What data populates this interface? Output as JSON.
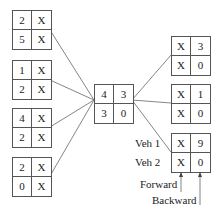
{
  "left_nodes": [
    {
      "id": "L1",
      "cells": [
        [
          "2",
          "X"
        ],
        [
          "5",
          "X"
        ]
      ]
    },
    {
      "id": "L2",
      "cells": [
        [
          "1",
          "X"
        ],
        [
          "2",
          "X"
        ]
      ]
    },
    {
      "id": "L3",
      "cells": [
        [
          "4",
          "X"
        ],
        [
          "2",
          "X"
        ]
      ]
    },
    {
      "id": "L4",
      "cells": [
        [
          "2",
          "X"
        ],
        [
          "0",
          "X"
        ]
      ]
    }
  ],
  "center_node": {
    "id": "C",
    "cells": [
      [
        "4",
        "3"
      ],
      [
        "3",
        "0"
      ]
    ]
  },
  "right_nodes": [
    {
      "id": "R1",
      "cells": [
        [
          "X",
          "3"
        ],
        [
          "X",
          "0"
        ]
      ]
    },
    {
      "id": "R2",
      "cells": [
        [
          "X",
          "1"
        ],
        [
          "X",
          "0"
        ]
      ]
    },
    {
      "id": "R3",
      "cells": [
        [
          "X",
          "9"
        ],
        [
          "X",
          "0"
        ]
      ]
    }
  ],
  "labels": {
    "veh1": "Veh 1",
    "veh2": "Veh 2",
    "forward": "Forward",
    "backward": "Backward"
  },
  "colors": {
    "line": "#555555",
    "text": "#222222"
  }
}
